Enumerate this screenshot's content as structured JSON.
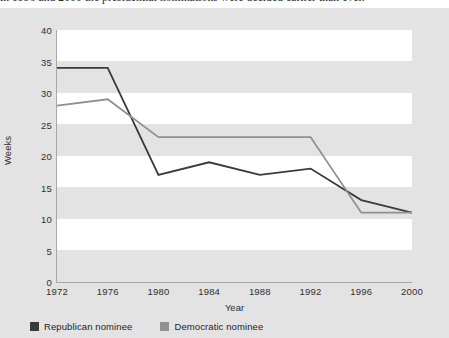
{
  "caption": {
    "text": "in 1996 and 2000 the presidential nominations were decided earlier than ever."
  },
  "legend": {
    "items": [
      {
        "label": "Republican nominee",
        "color": "#3a3a3a",
        "swatch": "legend-swatch-republican"
      },
      {
        "label": "Democratic nominee",
        "color": "#909090",
        "swatch": "legend-swatch-democratic"
      }
    ]
  },
  "chart_data": {
    "type": "line",
    "title": "",
    "xlabel": "Year",
    "ylabel": "Weeks",
    "categories": [
      "1972",
      "1976",
      "1980",
      "1984",
      "1988",
      "1992",
      "1996",
      "2000"
    ],
    "x": [
      1972,
      1976,
      1980,
      1984,
      1988,
      1992,
      1996,
      2000
    ],
    "series": [
      {
        "name": "Republican nominee",
        "color": "#3a3a3a",
        "values": [
          34,
          34,
          17,
          19,
          17,
          18,
          13,
          11
        ]
      },
      {
        "name": "Democratic nominee",
        "color": "#909090",
        "values": [
          28,
          29,
          23,
          23,
          23,
          23,
          11,
          11
        ]
      }
    ],
    "ylim": [
      0,
      40
    ],
    "yticks": [
      0,
      5,
      10,
      15,
      20,
      25,
      30,
      35,
      40
    ],
    "ytick_labels": [
      "0",
      "5",
      "10",
      "15",
      "20",
      "25",
      "30",
      "35",
      "40"
    ],
    "grid": "horizontal-bands",
    "legend_position": "bottom-left"
  }
}
